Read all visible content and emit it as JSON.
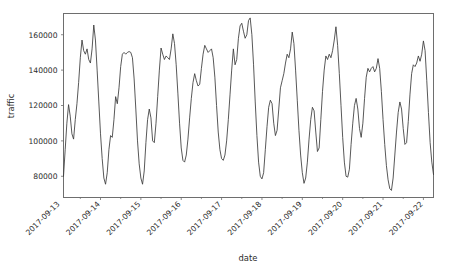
{
  "chart_data": {
    "type": "line",
    "title": "",
    "xlabel": "date",
    "ylabel": "traffic",
    "grid": false,
    "legend": null,
    "line_color": "#3a3a3a",
    "axes_color": "#6e6e6e",
    "background": "#ffffff",
    "ylim": [
      68000,
      172000
    ],
    "ytick_labels": [
      "80000",
      "100000",
      "120000",
      "140000",
      "160000"
    ],
    "ytick_values": [
      80000,
      100000,
      120000,
      140000,
      160000
    ],
    "xtick_labels": [
      "2017-09-13",
      "2017-09-14",
      "2017-09-15",
      "2017-09-16",
      "2017-09-17",
      "2017-09-18",
      "2017-09-19",
      "2017-09-20",
      "2017-09-21",
      "2017-09-22"
    ],
    "xtick_rotation_deg": 45,
    "x_start": "2017-09-13T02:00",
    "x_end": "2017-09-22T01:00",
    "x_unit": "hour",
    "series": [
      {
        "name": "traffic",
        "values": [
          80000,
          95000,
          110000,
          120500,
          114000,
          104000,
          101000,
          112000,
          121000,
          133000,
          147000,
          157000,
          151000,
          149000,
          152000,
          146000,
          144000,
          152000,
          165500,
          157000,
          140000,
          122000,
          104000,
          90000,
          79000,
          75500,
          82000,
          95000,
          103000,
          102000,
          112000,
          125000,
          121000,
          130000,
          142000,
          149000,
          150000,
          149000,
          150000,
          150500,
          150000,
          147000,
          135000,
          118000,
          100000,
          87000,
          79000,
          75500,
          83000,
          99000,
          112000,
          118000,
          113000,
          100000,
          99000,
          110000,
          125000,
          140000,
          152500,
          149000,
          146000,
          148000,
          147000,
          146000,
          152000,
          160500,
          155000,
          143000,
          127000,
          110000,
          96000,
          89000,
          88000,
          92000,
          101000,
          113000,
          124000,
          133000,
          138000,
          134000,
          131000,
          132000,
          141000,
          149000,
          154000,
          152000,
          150000,
          151000,
          152000,
          147000,
          136000,
          120000,
          105000,
          95000,
          90000,
          89000,
          92000,
          100000,
          112000,
          126000,
          140000,
          152000,
          143000,
          146000,
          158000,
          165000,
          166500,
          162000,
          158000,
          160000,
          168000,
          169500,
          160000,
          143000,
          122000,
          103000,
          88000,
          80000,
          78500,
          82000,
          95000,
          108000,
          119000,
          123000,
          121000,
          110000,
          103000,
          106000,
          118000,
          130000,
          134000,
          138000,
          144000,
          149000,
          147000,
          152000,
          161500,
          155000,
          140000,
          123000,
          106000,
          92000,
          82000,
          76000,
          79000,
          88000,
          101000,
          112000,
          119000,
          117000,
          105000,
          94000,
          96000,
          112000,
          128000,
          140000,
          148000,
          146000,
          149000,
          147000,
          151000,
          157000,
          164500,
          154000,
          138000,
          120000,
          102000,
          88000,
          80000,
          79500,
          84000,
          98000,
          110000,
          120000,
          124000,
          118000,
          107000,
          102000,
          110000,
          124000,
          136000,
          141000,
          139000,
          141000,
          142000,
          139000,
          141000,
          146500,
          141000,
          128000,
          112000,
          98000,
          86000,
          78000,
          73000,
          72000,
          79000,
          92000,
          105000,
          116000,
          122000,
          118000,
          107000,
          98000,
          99000,
          111000,
          126000,
          138000,
          143000,
          142000,
          144000,
          148000,
          145000,
          149000,
          156500,
          151000,
          134000,
          116000,
          99000,
          88000,
          81000
        ]
      }
    ]
  }
}
